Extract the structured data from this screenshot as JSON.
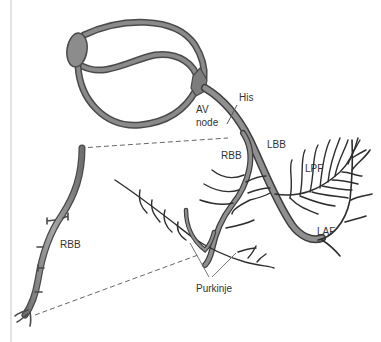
{
  "diagram": {
    "labels": {
      "his": "His",
      "av_node_line1": "AV",
      "av_node_line2": "node",
      "lbb": "LBB",
      "rbb_main": "RBB",
      "rbb_inset": "RBB",
      "lpf": "LPF",
      "laf": "LAF",
      "purkinje": "Purkinje"
    },
    "colors": {
      "pathway_fill": "#8a8a8a",
      "pathway_outline": "#4a4a4a",
      "node_fill": "#8c8c8c",
      "fiber": "#2e2e2e",
      "dashed_line": "#666666",
      "label": "#333333",
      "leader_line": "#777777",
      "left_rule": "#e2e2e2"
    }
  }
}
